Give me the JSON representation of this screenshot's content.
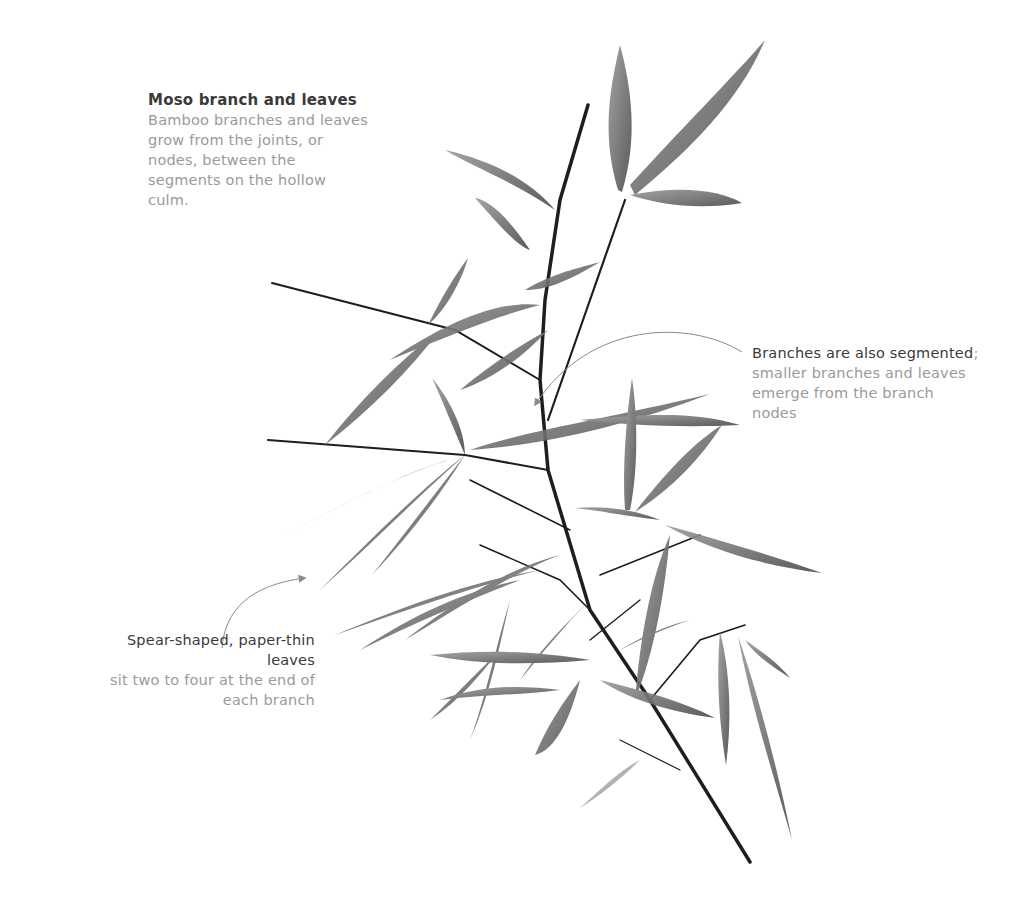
{
  "annotations": {
    "top": {
      "title": "Moso branch and leaves",
      "body": "Bamboo branches and leaves grow from the joints, or nodes, between the segments on the hollow culm."
    },
    "right": {
      "strong": "Branches are also segmented",
      "punct": ";",
      "body": " smaller branches and leaves emerge from the branch nodes"
    },
    "left": {
      "strong": "Spear-shaped, paper-thin leaves",
      "body": "sit two to four at the end of each branch"
    }
  },
  "colors": {
    "background": "#ffffff",
    "heading_text": "#3a3a3a",
    "body_text": "#9a9a9a",
    "stem": "#1e1e1e",
    "leaf": "#6e6e6e",
    "callout_line": "#8a8a8a"
  },
  "illustration": {
    "subject": "moso bamboo branch with leaves",
    "icon": "bamboo-branch-illustration"
  }
}
